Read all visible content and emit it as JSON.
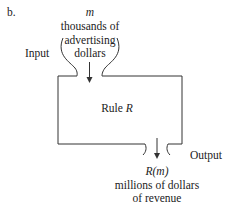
{
  "figure": {
    "label": "b."
  },
  "input": {
    "side_label": "Input",
    "variable": "m",
    "lines": [
      "thousands of",
      "advertising",
      "dollars"
    ]
  },
  "machine": {
    "label_prefix": "Rule ",
    "label_var": "R"
  },
  "output": {
    "side_label": "Output",
    "expression": "R(m)",
    "lines": [
      "millions of dollars",
      "of revenue"
    ]
  },
  "colors": {
    "stroke": "#333333",
    "text": "#222222",
    "background": "#ffffff"
  }
}
